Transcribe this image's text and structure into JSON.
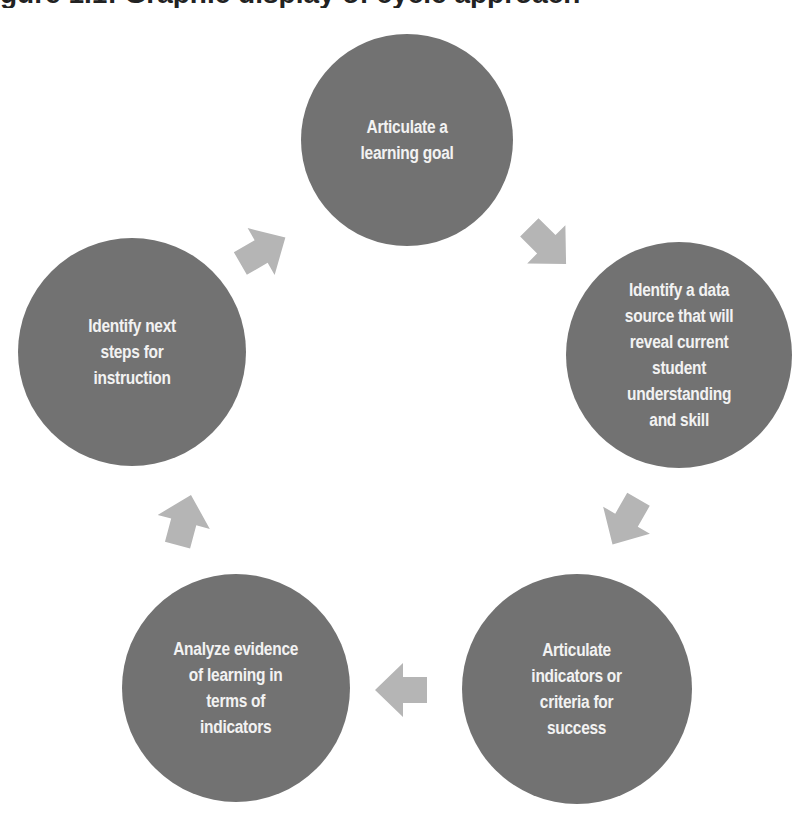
{
  "heading": {
    "text": "gure 1.1: Graphic display of cycle approach",
    "note": "top line cropped; only descenders visible"
  },
  "colors": {
    "node_fill": "#727272",
    "node_text": "#f2f2f2",
    "arrow_fill": "#b5b5b5",
    "background": "#ffffff"
  },
  "cycle": {
    "nodes": [
      {
        "id": "learning-goal",
        "label": "Articulate a\nlearning goal",
        "cx": 407,
        "cy": 140,
        "r": 106
      },
      {
        "id": "data-source",
        "label": "Identify a data\nsource that will\nreveal current\nstudent\nunderstanding\nand skill",
        "cx": 679,
        "cy": 355,
        "r": 113
      },
      {
        "id": "success-criteria",
        "label": "Articulate\nindicators or\ncriteria for\nsuccess",
        "cx": 577,
        "cy": 689,
        "r": 115
      },
      {
        "id": "analyze-evidence",
        "label": "Analyze evidence\nof learning in\nterms of\nindicators",
        "cx": 236,
        "cy": 688,
        "r": 114
      },
      {
        "id": "next-steps",
        "label": "Identify next\nsteps for\ninstruction",
        "cx": 132,
        "cy": 352,
        "r": 114
      }
    ],
    "arrows": [
      {
        "from": "learning-goal",
        "to": "data-source",
        "x": 518,
        "y": 216,
        "rotation": 45
      },
      {
        "from": "data-source",
        "to": "success-criteria",
        "x": 597,
        "y": 492,
        "rotation": 120
      },
      {
        "from": "success-criteria",
        "to": "analyze-evidence",
        "x": 373,
        "y": 661,
        "rotation": 180
      },
      {
        "from": "analyze-evidence",
        "to": "next-steps",
        "x": 155,
        "y": 492,
        "rotation": -75
      },
      {
        "from": "next-steps",
        "to": "learning-goal",
        "x": 233,
        "y": 222,
        "rotation": -30
      }
    ]
  }
}
